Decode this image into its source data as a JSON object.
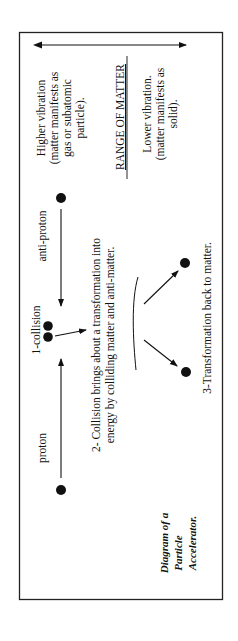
{
  "diagram": {
    "range": {
      "higher": [
        "Higher vibration",
        "(matter manifests as",
        "gas or subatomic",
        "particle)."
      ],
      "title": "RANGE OF MATTER",
      "lower": [
        "Lower vibration.",
        "(matter manifests as",
        "solid)."
      ]
    },
    "particles": {
      "anti_proton": "anti-proton",
      "proton": "proton",
      "collision": "1-collision"
    },
    "steps": {
      "step2": [
        "2- Collision brings about a transformation into",
        "energy by colliding matter and anti-matter."
      ],
      "step3": "3-Transformation back to matter."
    },
    "caption": [
      "Diagram of a",
      "Particle",
      "Accelerator."
    ],
    "colors": {
      "ink": "#111111",
      "background": "#ffffff"
    }
  }
}
